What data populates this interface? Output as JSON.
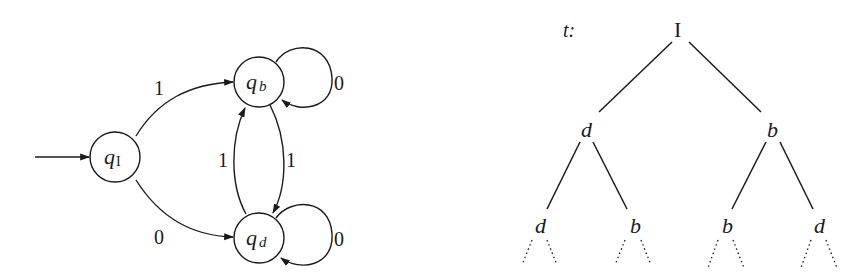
{
  "automaton": {
    "states": [
      {
        "id": "qI",
        "symbol": "q",
        "subscript": "I",
        "initial": true
      },
      {
        "id": "qb",
        "symbol": "q",
        "subscript": "b",
        "initial": false
      },
      {
        "id": "qd",
        "symbol": "q",
        "subscript": "d",
        "initial": false
      }
    ],
    "transitions": [
      {
        "from": "qI",
        "to": "qb",
        "label": "1"
      },
      {
        "from": "qI",
        "to": "qd",
        "label": "0"
      },
      {
        "from": "qd",
        "to": "qb",
        "label": "1"
      },
      {
        "from": "qb",
        "to": "qd",
        "label": "1"
      },
      {
        "from": "qb",
        "to": "qb",
        "label": "0"
      },
      {
        "from": "qd",
        "to": "qd",
        "label": "0"
      }
    ],
    "labels": {
      "qI_to_qb": "1",
      "qI_to_qd": "0",
      "qd_to_qb": "1",
      "qb_to_qd": "1",
      "qb_loop": "0",
      "qd_loop": "0"
    }
  },
  "tree": {
    "name": "t:",
    "root": "I",
    "level1": [
      "d",
      "b"
    ],
    "level2": [
      "d",
      "b",
      "b",
      "d"
    ],
    "continues": true
  },
  "colors": {
    "ink": "#1a1a1a",
    "background": "#ffffff"
  }
}
